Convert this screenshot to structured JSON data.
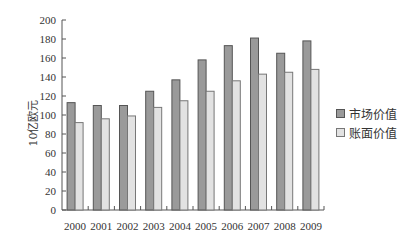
{
  "chart_data": {
    "type": "bar",
    "title": "",
    "xlabel": "",
    "ylabel": "10亿欧元",
    "categories": [
      "2000",
      "2001",
      "2002",
      "2003",
      "2004",
      "2005",
      "2006",
      "2007",
      "2008",
      "2009"
    ],
    "series": [
      {
        "name": "市场价值",
        "color": "#9a9a9a",
        "values": [
          113,
          110,
          110,
          125,
          137,
          158,
          173,
          181,
          165,
          178
        ]
      },
      {
        "name": "账面价值",
        "color": "#e2e2e2",
        "values": [
          92,
          96,
          99,
          108,
          115,
          125,
          136,
          143,
          145,
          148
        ]
      }
    ],
    "ylim": [
      0,
      200
    ],
    "yticks": [
      0,
      20,
      40,
      60,
      80,
      100,
      120,
      140,
      160,
      180,
      200
    ],
    "grid": false,
    "legend_position": "right"
  },
  "legend": {
    "items": [
      {
        "label": "市场价值",
        "color": "#9a9a9a"
      },
      {
        "label": "账面价值",
        "color": "#e2e2e2"
      }
    ]
  },
  "axis": {
    "ylabel": "10亿欧元"
  }
}
